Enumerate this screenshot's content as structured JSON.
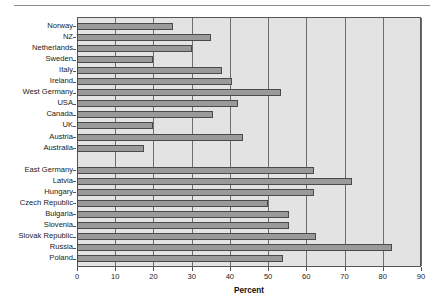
{
  "chart_data": {
    "type": "bar",
    "orientation": "horizontal",
    "title": "",
    "xlabel": "Percent",
    "ylabel": "",
    "xlim": [
      0,
      90
    ],
    "xticks": [
      0,
      10,
      20,
      30,
      40,
      50,
      60,
      70,
      80,
      90
    ],
    "grid": true,
    "legend": false,
    "bar_color": "#9a9a9a",
    "bar_edge_color": "#4a4a4a",
    "plot_background": "#e3e3e3",
    "groups": [
      {
        "name": "western",
        "categories": [
          "Norway",
          "NZ",
          "Netherlands",
          "Sweden",
          "Italy",
          "Ireland",
          "West Germany",
          "USA",
          "Canada",
          "UK",
          "Austria",
          "Australia"
        ],
        "values": [
          25,
          35,
          30,
          20,
          38,
          40.5,
          53.5,
          42,
          35.5,
          20,
          43.5,
          17.5
        ]
      },
      {
        "name": "eastern",
        "categories": [
          "East Germany",
          "Latvia",
          "Hungary",
          "Czech Republic",
          "Bulgaria",
          "Slovenia",
          "Slovak Republic",
          "Russia",
          "Poland"
        ],
        "values": [
          62,
          72,
          62,
          50,
          55.5,
          55.5,
          62.5,
          82.5,
          54
        ]
      }
    ],
    "categories": [
      "Norway",
      "NZ",
      "Netherlands",
      "Sweden",
      "Italy",
      "Ireland",
      "West Germany",
      "USA",
      "Canada",
      "UK",
      "Austria",
      "Australia",
      "East Germany",
      "Latvia",
      "Hungary",
      "Czech Republic",
      "Bulgaria",
      "Slovenia",
      "Slovak Republic",
      "Russia",
      "Poland"
    ],
    "values": [
      25,
      35,
      30,
      20,
      38,
      40.5,
      53.5,
      42,
      35.5,
      20,
      43.5,
      17.5,
      62,
      72,
      62,
      50,
      55.5,
      55.5,
      62.5,
      82.5,
      54
    ]
  }
}
